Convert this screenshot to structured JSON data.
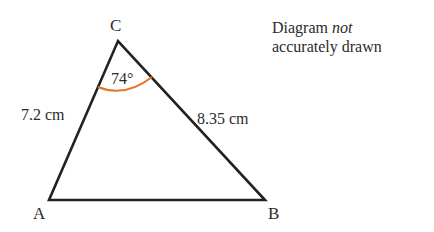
{
  "diagram": {
    "type": "triangle",
    "vertices": [
      {
        "label": "A",
        "x": 49,
        "y": 200
      },
      {
        "label": "B",
        "x": 265,
        "y": 200
      },
      {
        "label": "C",
        "x": 118,
        "y": 41
      }
    ],
    "sides": [
      {
        "between": "AC",
        "label": "7.2 cm"
      },
      {
        "between": "BC",
        "label": "8.35 cm"
      },
      {
        "between": "AB",
        "label": ""
      }
    ],
    "angle": {
      "vertex": "C",
      "label": "74°",
      "arc_color": "#e8742a"
    },
    "line_color": "#222222"
  },
  "note": {
    "line1_prefix": "Diagram ",
    "line1_emphasis": "not",
    "line2": "accurately drawn"
  }
}
